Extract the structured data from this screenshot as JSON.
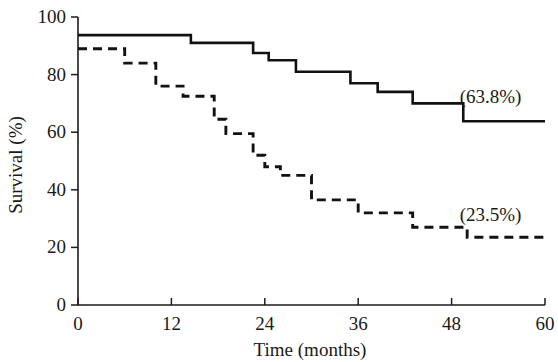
{
  "chart_data": {
    "type": "line",
    "title": "",
    "subtitle": "",
    "xlabel": "Time (months)",
    "ylabel": "Survival (%)",
    "xlim": [
      0,
      60
    ],
    "ylim": [
      0,
      100
    ],
    "xticks": [
      "0",
      "12",
      "24",
      "36",
      "48",
      "60"
    ],
    "xtick_values": [
      0,
      12,
      24,
      36,
      48,
      60
    ],
    "yticks": [
      "0",
      "20",
      "40",
      "60",
      "80",
      "100"
    ],
    "ytick_values": [
      0,
      20,
      40,
      60,
      80,
      100
    ],
    "grid": false,
    "legend_position": "inline-right-annotation",
    "step_style": "post",
    "series": [
      {
        "name": "solid-curve",
        "line_style": "solid",
        "end_label": "(63.8%)",
        "final_value": 63.8,
        "x": [
          0,
          10.0,
          12.0,
          14.5,
          20.0,
          22.5,
          24.5,
          26.0,
          28.0,
          31.0,
          35.0,
          38.5,
          41.0,
          43.0,
          45.5,
          49.5,
          60.0
        ],
        "y": [
          93.7,
          93.7,
          93.7,
          91.0,
          91.0,
          87.5,
          85.0,
          85.0,
          81.0,
          81.0,
          77.0,
          74.0,
          74.0,
          70.0,
          70.0,
          63.8,
          63.8
        ]
      },
      {
        "name": "dashed-curve",
        "line_style": "dashed",
        "end_label": "(23.5%)",
        "final_value": 23.5,
        "x": [
          0,
          4.0,
          6.0,
          8.5,
          10.0,
          12.0,
          13.5,
          15.5,
          17.5,
          19.0,
          21.0,
          22.5,
          24.0,
          26.0,
          28.0,
          30.0,
          33.0,
          36.0,
          40.0,
          43.0,
          50.0,
          60.0
        ],
        "y": [
          89.0,
          89.0,
          84.0,
          84.0,
          76.0,
          76.0,
          72.5,
          72.5,
          64.5,
          59.5,
          59.5,
          52.0,
          48.0,
          45.0,
          45.0,
          36.5,
          36.5,
          32.0,
          32.0,
          27.0,
          23.5,
          23.5
        ]
      }
    ],
    "annotations": [
      {
        "text": "(63.8%)",
        "x": 53.0,
        "y": 70.0
      },
      {
        "text": "(23.5%)",
        "x": 53.0,
        "y": 29.0
      }
    ]
  },
  "axes": {
    "x_title": "Time (months)",
    "y_title": "Survival (%)"
  },
  "colors": {
    "ink": "#121212",
    "background": "#ffffff"
  }
}
